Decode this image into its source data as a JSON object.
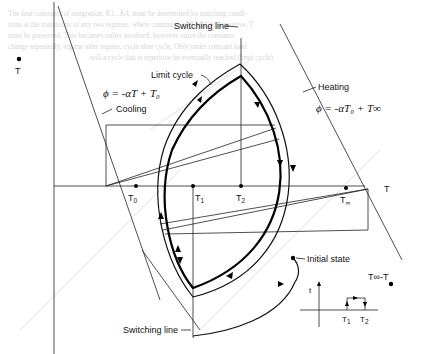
{
  "figure": {
    "type": "phase-plane diagram",
    "background_text": [
      "The four constants of integration, K1...K4, must be determined by matching condi-",
      "tions at the transitions of any two regimes, where continuity of T and its derivative, T",
      "must be preserved.  This becomes rather involved; however, since the constants",
      "change repeatedly, regime after regime, cycle after cycle.  Only under constant load",
      "will a cycle that is repetitive be eventually reached (limit cycle)."
    ],
    "axes": {
      "vertical_axis_label": "T",
      "vertical_axis_marker": "dot",
      "horizontal_axis_label": "T"
    },
    "labels": {
      "switching_line_top": "Switching line",
      "switching_line_bottom": "Switching line",
      "limit_cycle": "Limit cycle",
      "cooling": "Cooling",
      "heating": "Heating",
      "initial_state": "Initial state",
      "cooling_equation": "ϕ = -αT + T₀",
      "heating_equation": "ϕ = -αT₀ + T∞",
      "t_inf_minus_t": "T∞-T"
    },
    "axis_points": [
      {
        "name": "T0",
        "label": "T",
        "sub": "0"
      },
      {
        "name": "T1",
        "label": "T",
        "sub": "1"
      },
      {
        "name": "T2",
        "label": "T",
        "sub": "2"
      },
      {
        "name": "Tinf",
        "label": "T",
        "sub": "∞"
      }
    ],
    "inset": {
      "vertical_label": "t",
      "points": [
        {
          "label": "T",
          "sub": "1"
        },
        {
          "label": "T",
          "sub": "2"
        }
      ]
    }
  }
}
